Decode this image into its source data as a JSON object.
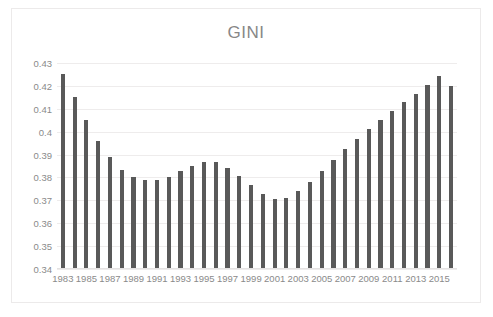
{
  "chart_data": {
    "type": "bar",
    "title": "GINI",
    "xlabel": "",
    "ylabel": "",
    "ylim": [
      0.34,
      0.43
    ],
    "ytick_labels": [
      "0.43",
      "0.42",
      "0.41",
      "0.4",
      "0.39",
      "0.38",
      "0.37",
      "0.36",
      "0.35",
      "0.34"
    ],
    "ytick_values": [
      0.43,
      0.42,
      0.41,
      0.4,
      0.39,
      0.38,
      0.37,
      0.36,
      0.35,
      0.34
    ],
    "grid": true,
    "legend": "none",
    "bar_color": "#595959",
    "categories": [
      "1983",
      "1984",
      "1985",
      "1986",
      "1987",
      "1988",
      "1989",
      "1990",
      "1991",
      "1992",
      "1993",
      "1994",
      "1995",
      "1996",
      "1997",
      "1998",
      "1999",
      "2000",
      "2001",
      "2002",
      "2003",
      "2004",
      "2005",
      "2006",
      "2007",
      "2008",
      "2009",
      "2010",
      "2011",
      "2012",
      "2013",
      "2014",
      "2015",
      "2016"
    ],
    "xtick_labels_shown": [
      "1983",
      "1985",
      "1987",
      "1989",
      "1991",
      "1993",
      "1995",
      "1997",
      "1999",
      "2001",
      "2003",
      "2005",
      "2007",
      "2009",
      "2011",
      "2013",
      "2015"
    ],
    "values": [
      0.425,
      0.415,
      0.405,
      0.396,
      0.3888,
      0.3833,
      0.3802,
      0.379,
      0.379,
      0.3803,
      0.3828,
      0.3852,
      0.3868,
      0.3866,
      0.3842,
      0.3805,
      0.3765,
      0.3727,
      0.3706,
      0.371,
      0.374,
      0.3778,
      0.3827,
      0.3877,
      0.3925,
      0.397,
      0.4013,
      0.4052,
      0.409,
      0.4128,
      0.4163,
      0.4205,
      0.4245,
      0.4198
    ]
  }
}
